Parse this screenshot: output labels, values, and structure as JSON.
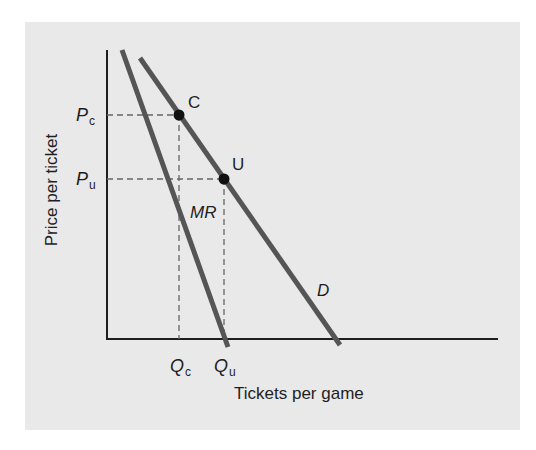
{
  "diagram": {
    "y_axis_label": "Price per ticket",
    "x_axis_label": "Tickets per game",
    "price_labels": {
      "pc_main": "P",
      "pc_sub": "c",
      "pu_main": "P",
      "pu_sub": "u"
    },
    "quantity_labels": {
      "qc_main": "Q",
      "qc_sub": "c",
      "qu_main": "Q",
      "qu_sub": "u"
    },
    "curves": {
      "demand": "D",
      "marginal_revenue": "MR"
    },
    "points": {
      "C": "C",
      "U": "U"
    },
    "colors": {
      "background_panel": "#e9e9e9",
      "curve": "#555555",
      "axis": "#1e1e1e",
      "dashed": "#666666",
      "point": "#111111"
    }
  }
}
